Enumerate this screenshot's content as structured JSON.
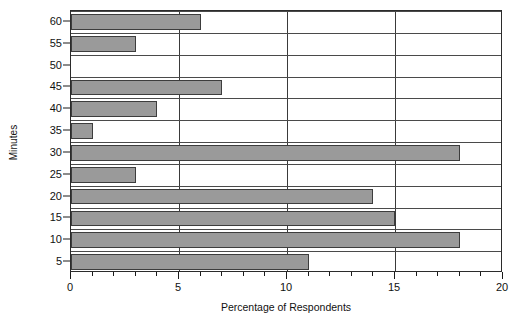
{
  "chart_data": {
    "type": "bar",
    "orientation": "horizontal",
    "title": "",
    "xlabel": "Percentage of Respondents",
    "ylabel": "Minutes",
    "categories": [
      5,
      10,
      15,
      20,
      25,
      30,
      35,
      40,
      45,
      50,
      55,
      60
    ],
    "values": [
      11,
      18,
      15,
      14,
      3,
      18,
      1,
      4,
      7,
      0,
      3,
      6
    ],
    "xlim": [
      0,
      20
    ],
    "xticks_major": [
      0,
      5,
      10,
      15,
      20
    ],
    "xtick_labels": [
      "0",
      "5",
      "10",
      "15",
      "20"
    ],
    "xtick_minor_step": 1,
    "yticks": [
      5,
      10,
      15,
      20,
      25,
      30,
      35,
      40,
      45,
      50,
      55,
      60
    ],
    "ytick_labels": [
      "5",
      "10",
      "15",
      "20",
      "25",
      "30",
      "35",
      "40",
      "45",
      "50",
      "55",
      "60"
    ],
    "grid": "vertical-major-and-horizontal-category",
    "legend": "none",
    "bar_fill": "#9a9a9a",
    "bar_edge": "#3d3d3d",
    "axis_color": "#2b2b2b",
    "background": "#ffffff",
    "series": [
      {
        "name": "Percentage of Respondents",
        "points": [
          {
            "category": 5,
            "value": 11
          },
          {
            "category": 10,
            "value": 18
          },
          {
            "category": 15,
            "value": 15
          },
          {
            "category": 20,
            "value": 14
          },
          {
            "category": 25,
            "value": 3
          },
          {
            "category": 30,
            "value": 18
          },
          {
            "category": 35,
            "value": 1
          },
          {
            "category": 40,
            "value": 4
          },
          {
            "category": 45,
            "value": 7
          },
          {
            "category": 50,
            "value": 0
          },
          {
            "category": 55,
            "value": 3
          },
          {
            "category": 60,
            "value": 6
          }
        ]
      }
    ]
  }
}
